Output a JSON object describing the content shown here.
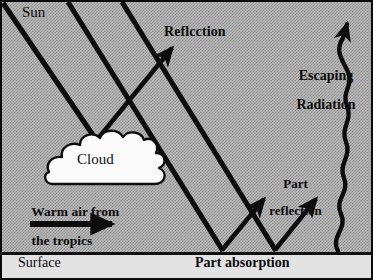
{
  "figure": {
    "colors": {
      "ink": "#0d0d0d",
      "sky_fill": "#b9b9b9",
      "sky_dither": "#8f8f8f",
      "surface_fill": "#e2e2e2",
      "cloud_fill": "#fbfbfb",
      "border": "#0a0a0a"
    }
  },
  "labels": {
    "sun": "Sun",
    "reflection": "Reflcction",
    "escaping_radiation_line1": "Escaping",
    "escaping_radiation_line2": "Radiation",
    "cloud": "Cloud",
    "warm_air_line1": "Warm air from",
    "warm_air_line2": "the tropics",
    "part_reflection_line1": "Part",
    "part_reflection_line2": "reflection",
    "surface": "Surface",
    "part_absorption": "Part absorption"
  },
  "elements": {
    "sun_rays": [
      {
        "name": "sun-ray-1",
        "from": [
          4,
          4
        ],
        "to": [
          96,
          140
        ]
      },
      {
        "name": "sun-ray-2",
        "from": [
          68,
          2
        ],
        "to": [
          222,
          250
        ]
      },
      {
        "name": "sun-ray-3",
        "from": [
          122,
          2
        ],
        "to": [
          275,
          250
        ]
      }
    ],
    "cloud_reflection_ray": {
      "from": [
        96,
        140
      ],
      "to": [
        175,
        45
      ]
    },
    "surface_reflections": [
      {
        "name": "part-reflection-arrow-left",
        "from": [
          222,
          250
        ],
        "to": [
          266,
          196
        ]
      },
      {
        "name": "part-reflection-arrow-right",
        "from": [
          275,
          250
        ],
        "to": [
          318,
          196
        ]
      }
    ],
    "warm_air_arrow": {
      "from": [
        30,
        224
      ],
      "to": [
        118,
        224
      ]
    },
    "escaping_radiation_wave": {
      "from": [
        340,
        250
      ],
      "to": [
        346,
        16
      ],
      "type": "sinusoid"
    }
  }
}
